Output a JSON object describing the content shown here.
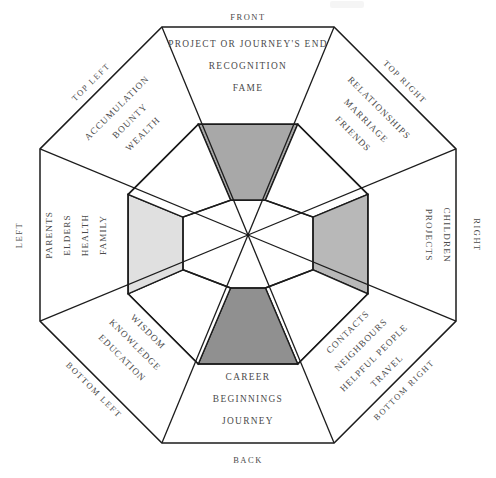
{
  "diagram": {
    "shape": "octagon",
    "colors": {
      "outline": "#1c1c1c",
      "background": "#ffffff",
      "text": "#4a4a4a",
      "shade_top": "#a8a8a8",
      "shade_left": "#e0e0e0",
      "shade_right": "#b8b8b8",
      "shade_bottom": "#909090"
    },
    "sectors": [
      {
        "id": "front",
        "direction": "FRONT",
        "direction_position": "top-outside",
        "keywords": [
          "PROJECT OR JOURNEY'S END",
          "RECOGNITION",
          "FAME"
        ],
        "inner_shade": "#a8a8a8",
        "rotation": 0
      },
      {
        "id": "top-right",
        "direction": "TOP RIGHT",
        "direction_position": "upper-right-edge",
        "keywords": [
          "RELATIONSHIPS",
          "MARRIAGE",
          "FRIENDS"
        ],
        "inner_shade": "none",
        "rotation": 45
      },
      {
        "id": "right",
        "direction": "RIGHT",
        "direction_position": "right-outside",
        "keywords": [
          "CHILDREN",
          "PROJECTS"
        ],
        "inner_shade": "#b8b8b8",
        "rotation": 90
      },
      {
        "id": "bottom-right",
        "direction": "BOTTOM RIGHT",
        "direction_position": "lower-right-edge",
        "keywords": [
          "CONTACTS",
          "NEIGHBOURS",
          "HELPFUL PEOPLE",
          "TRAVEL"
        ],
        "inner_shade": "none",
        "rotation": 135
      },
      {
        "id": "back",
        "direction": "BACK",
        "direction_position": "bottom-outside",
        "keywords": [
          "CAREER",
          "BEGINNINGS",
          "JOURNEY"
        ],
        "inner_shade": "#909090",
        "rotation": 180
      },
      {
        "id": "bottom-left",
        "direction": "BOTTOM LEFT",
        "direction_position": "lower-left-edge",
        "keywords": [
          "WISDOM",
          "KNOWLEDGE",
          "EDUCATION"
        ],
        "inner_shade": "none",
        "rotation": 225
      },
      {
        "id": "left",
        "direction": "LEFT",
        "direction_position": "left-outside",
        "keywords": [
          "PARENTS",
          "ELDERS",
          "HEALTH",
          "FAMILY"
        ],
        "inner_shade": "#e0e0e0",
        "rotation": 270
      },
      {
        "id": "top-left",
        "direction": "TOP LEFT",
        "direction_position": "upper-left-edge",
        "keywords": [
          "ACCUMULATION",
          "BOUNTY",
          "WEALTH"
        ],
        "inner_shade": "none",
        "rotation": 315
      }
    ],
    "labels": {
      "front": "FRONT",
      "back": "BACK",
      "left": "LEFT",
      "right": "RIGHT",
      "top_left": "TOP LEFT",
      "top_right": "TOP RIGHT",
      "bottom_left": "BOTTOM LEFT",
      "bottom_right": "BOTTOM RIGHT",
      "front_k1": "PROJECT OR JOURNEY'S END",
      "front_k2": "RECOGNITION",
      "front_k3": "FAME",
      "back_k1": "CAREER",
      "back_k2": "BEGINNINGS",
      "back_k3": "JOURNEY",
      "left_k1": "PARENTS",
      "left_k2": "ELDERS",
      "left_k3": "HEALTH",
      "left_k4": "FAMILY",
      "right_k1": "CHILDREN",
      "right_k2": "PROJECTS",
      "top_left_k1": "ACCUMULATION",
      "top_left_k2": "BOUNTY",
      "top_left_k3": "WEALTH",
      "top_right_k1": "RELATIONSHIPS",
      "top_right_k2": "MARRIAGE",
      "top_right_k3": "FRIENDS",
      "bottom_left_k1": "WISDOM",
      "bottom_left_k2": "KNOWLEDGE",
      "bottom_left_k3": "EDUCATION",
      "bottom_right_k1": "CONTACTS",
      "bottom_right_k2": "NEIGHBOURS",
      "bottom_right_k3": "HELPFUL PEOPLE",
      "bottom_right_k4": "TRAVEL"
    }
  }
}
